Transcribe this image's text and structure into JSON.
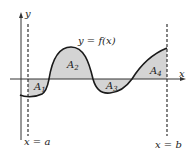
{
  "diagram": {
    "curve_label": "y = f(x)",
    "axis_labels": {
      "x": "x",
      "y": "y"
    },
    "bounds": {
      "left": "x = a",
      "right": "x = b"
    },
    "regions": [
      {
        "name": "A",
        "sub": "1",
        "position": "below x-axis",
        "shaded": true
      },
      {
        "name": "A",
        "sub": "2",
        "position": "above x-axis",
        "shaded": true
      },
      {
        "name": "A",
        "sub": "3",
        "position": "below x-axis",
        "shaded": true
      },
      {
        "name": "A",
        "sub": "4",
        "position": "above x-axis",
        "shaded": true
      }
    ],
    "colors": {
      "shade": "#d4d4d4",
      "line": "#1a1a1a",
      "axis": "#333333"
    }
  }
}
